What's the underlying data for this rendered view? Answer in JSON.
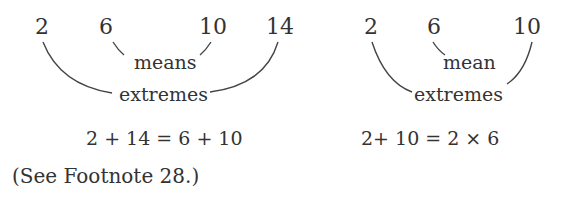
{
  "left_diagram": {
    "numbers": [
      "2",
      "6",
      "10",
      "14"
    ],
    "inner_label": "means",
    "outer_label": "extremes",
    "equation": "2 + 14 = 6 + 10"
  },
  "right_diagram": {
    "numbers": [
      "2",
      "6",
      "10"
    ],
    "inner_label": "mean",
    "outer_label": "extremes",
    "equation": "2+ 10 = 2 × 6"
  },
  "footnote": "(See Footnote 28.)",
  "colors": {
    "text": "#333333",
    "lines": "#444444",
    "background": "#ffffff"
  }
}
